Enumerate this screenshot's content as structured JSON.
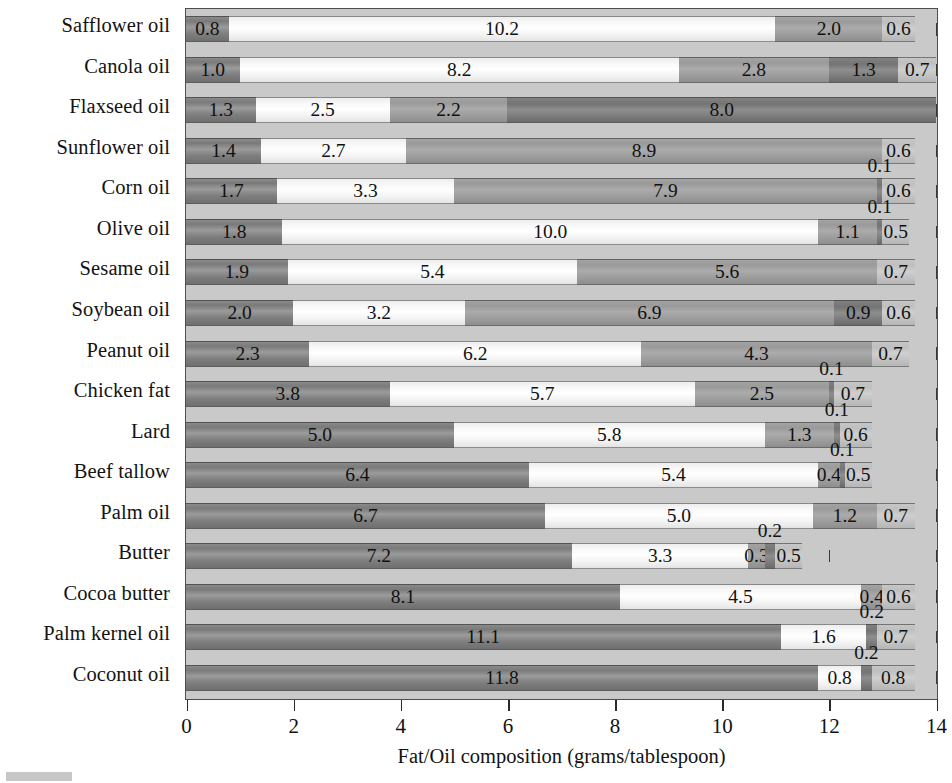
{
  "chart_data": {
    "type": "bar",
    "orientation": "horizontal",
    "stacked": true,
    "title": "",
    "xlabel": "Fat/Oil composition (grams/tablespoon)",
    "ylabel": "",
    "xlim": [
      0,
      14
    ],
    "xticks": [
      0,
      2,
      4,
      6,
      8,
      10,
      12,
      14
    ],
    "xticklabels": [
      "0",
      "2",
      "4",
      "6",
      "8",
      "10",
      "12",
      "14"
    ],
    "grid": true,
    "legend": "none",
    "categories": [
      "Safflower oil",
      "Canola oil",
      "Flaxseed oil",
      "Sunflower oil",
      "Corn oil",
      "Olive oil",
      "Sesame oil",
      "Soybean oil",
      "Peanut oil",
      "Chicken fat",
      "Lard",
      "Beef tallow",
      "Palm oil",
      "Butter",
      "Cocoa butter",
      "Palm kernel oil",
      "Coconut oil"
    ],
    "series": [
      {
        "name": "Saturated fat",
        "color": "#7e7e7e",
        "values": [
          0.8,
          1.0,
          1.3,
          1.4,
          1.7,
          1.8,
          1.9,
          2.0,
          2.3,
          3.8,
          5.0,
          6.4,
          6.7,
          7.2,
          8.1,
          11.1,
          11.8
        ]
      },
      {
        "name": "Monounsaturated fat",
        "color": "#f7f7f7",
        "values": [
          10.2,
          8.2,
          2.5,
          2.7,
          3.3,
          10.0,
          5.4,
          3.2,
          6.2,
          5.7,
          5.8,
          5.4,
          5.0,
          3.3,
          4.5,
          1.6,
          0.8
        ]
      },
      {
        "name": "Polyunsaturated fat",
        "color": "#a0a0a0",
        "values": [
          2.0,
          2.8,
          2.2,
          8.9,
          7.9,
          1.1,
          5.6,
          6.9,
          4.3,
          2.5,
          1.3,
          0.4,
          1.2,
          0.3,
          0.4,
          0.0,
          0.0
        ]
      },
      {
        "name": "Trans fat",
        "color": "#7a7a7a",
        "values": [
          0.0,
          0.0,
          8.0,
          0.0,
          0.1,
          0.1,
          0.0,
          0.0,
          0.1,
          0.1,
          0.1,
          0.1,
          0.0,
          0.2,
          0.0,
          0.2,
          0.2
        ]
      },
      {
        "name": "Other",
        "color": "#c4c4c4",
        "values": [
          0.6,
          0.7,
          0.0,
          0.6,
          0.6,
          0.5,
          0.7,
          0.6,
          0.7,
          0.7,
          0.6,
          0.5,
          0.7,
          0.5,
          0.6,
          0.7,
          0.8
        ]
      }
    ],
    "rows": [
      {
        "label": "Safflower oil",
        "segments": [
          {
            "series": "Saturated fat",
            "value": 0.8,
            "label": "0.8",
            "label_position": "inside"
          },
          {
            "series": "Monounsaturated fat",
            "value": 10.2,
            "label": "10.2",
            "label_position": "inside"
          },
          {
            "series": "Polyunsaturated fat",
            "value": 2.0,
            "label": "2.0",
            "label_position": "inside"
          },
          {
            "series": "Other",
            "value": 0.6,
            "label": "0.6",
            "label_position": "inside"
          }
        ]
      },
      {
        "label": "Canola oil",
        "segments": [
          {
            "series": "Saturated fat",
            "value": 1.0,
            "label": "1.0",
            "label_position": "inside"
          },
          {
            "series": "Monounsaturated fat",
            "value": 8.2,
            "label": "8.2",
            "label_position": "inside"
          },
          {
            "series": "Polyunsaturated fat",
            "value": 2.8,
            "label": "2.8",
            "label_position": "inside"
          },
          {
            "series": "Trans fat",
            "value": 1.3,
            "label": "1.3",
            "label_position": "inside"
          },
          {
            "series": "Other",
            "value": 0.7,
            "label": "0.7",
            "label_position": "inside"
          }
        ]
      },
      {
        "label": "Flaxseed oil",
        "segments": [
          {
            "series": "Saturated fat",
            "value": 1.3,
            "label": "1.3",
            "label_position": "inside"
          },
          {
            "series": "Monounsaturated fat",
            "value": 2.5,
            "label": "2.5",
            "label_position": "inside"
          },
          {
            "series": "Polyunsaturated fat",
            "value": 2.2,
            "label": "2.2",
            "label_position": "inside"
          },
          {
            "series": "Trans fat",
            "value": 8.0,
            "label": "8.0",
            "label_position": "inside"
          }
        ]
      },
      {
        "label": "Sunflower oil",
        "segments": [
          {
            "series": "Saturated fat",
            "value": 1.4,
            "label": "1.4",
            "label_position": "inside"
          },
          {
            "series": "Monounsaturated fat",
            "value": 2.7,
            "label": "2.7",
            "label_position": "inside"
          },
          {
            "series": "Polyunsaturated fat",
            "value": 8.9,
            "label": "8.9",
            "label_position": "inside"
          },
          {
            "series": "Other",
            "value": 0.6,
            "label": "0.6",
            "label_position": "inside"
          }
        ]
      },
      {
        "label": "Corn oil",
        "segments": [
          {
            "series": "Saturated fat",
            "value": 1.7,
            "label": "1.7",
            "label_position": "inside"
          },
          {
            "series": "Monounsaturated fat",
            "value": 3.3,
            "label": "3.3",
            "label_position": "inside"
          },
          {
            "series": "Polyunsaturated fat",
            "value": 7.9,
            "label": "7.9",
            "label_position": "inside"
          },
          {
            "series": "Trans fat",
            "value": 0.1,
            "label": "0.1",
            "label_position": "above"
          },
          {
            "series": "Other",
            "value": 0.6,
            "label": "0.6",
            "label_position": "inside"
          }
        ]
      },
      {
        "label": "Olive oil",
        "segments": [
          {
            "series": "Saturated fat",
            "value": 1.8,
            "label": "1.8",
            "label_position": "inside"
          },
          {
            "series": "Monounsaturated fat",
            "value": 10.0,
            "label": "10.0",
            "label_position": "inside"
          },
          {
            "series": "Polyunsaturated fat",
            "value": 1.1,
            "label": "1.1",
            "label_position": "inside"
          },
          {
            "series": "Trans fat",
            "value": 0.1,
            "label": "0.1",
            "label_position": "above"
          },
          {
            "series": "Other",
            "value": 0.5,
            "label": "0.5",
            "label_position": "inside"
          }
        ]
      },
      {
        "label": "Sesame oil",
        "segments": [
          {
            "series": "Saturated fat",
            "value": 1.9,
            "label": "1.9",
            "label_position": "inside"
          },
          {
            "series": "Monounsaturated fat",
            "value": 5.4,
            "label": "5.4",
            "label_position": "inside"
          },
          {
            "series": "Polyunsaturated fat",
            "value": 5.6,
            "label": "5.6",
            "label_position": "inside"
          },
          {
            "series": "Other",
            "value": 0.7,
            "label": "0.7",
            "label_position": "inside"
          }
        ]
      },
      {
        "label": "Soybean oil",
        "segments": [
          {
            "series": "Saturated fat",
            "value": 2.0,
            "label": "2.0",
            "label_position": "inside"
          },
          {
            "series": "Monounsaturated fat",
            "value": 3.2,
            "label": "3.2",
            "label_position": "inside"
          },
          {
            "series": "Polyunsaturated fat",
            "value": 6.9,
            "label": "6.9",
            "label_position": "inside"
          },
          {
            "series": "Trans fat",
            "value": 0.9,
            "label": "0.9",
            "label_position": "inside"
          },
          {
            "series": "Other",
            "value": 0.6,
            "label": "0.6",
            "label_position": "inside"
          }
        ]
      },
      {
        "label": "Peanut oil",
        "segments": [
          {
            "series": "Saturated fat",
            "value": 2.3,
            "label": "2.3",
            "label_position": "inside"
          },
          {
            "series": "Monounsaturated fat",
            "value": 6.2,
            "label": "6.2",
            "label_position": "inside"
          },
          {
            "series": "Polyunsaturated fat",
            "value": 4.3,
            "label": "4.3",
            "label_position": "inside"
          },
          {
            "series": "Other",
            "value": 0.7,
            "label": "0.7",
            "label_position": "inside"
          }
        ]
      },
      {
        "label": "Chicken fat",
        "segments": [
          {
            "series": "Saturated fat",
            "value": 3.8,
            "label": "3.8",
            "label_position": "inside"
          },
          {
            "series": "Monounsaturated fat",
            "value": 5.7,
            "label": "5.7",
            "label_position": "inside"
          },
          {
            "series": "Polyunsaturated fat",
            "value": 2.5,
            "label": "2.5",
            "label_position": "inside"
          },
          {
            "series": "Trans fat",
            "value": 0.1,
            "label": "0.1",
            "label_position": "above"
          },
          {
            "series": "Other",
            "value": 0.7,
            "label": "0.7",
            "label_position": "inside"
          }
        ]
      },
      {
        "label": "Lard",
        "segments": [
          {
            "series": "Saturated fat",
            "value": 5.0,
            "label": "5.0",
            "label_position": "inside"
          },
          {
            "series": "Monounsaturated fat",
            "value": 5.8,
            "label": "5.8",
            "label_position": "inside"
          },
          {
            "series": "Polyunsaturated fat",
            "value": 1.3,
            "label": "1.3",
            "label_position": "inside"
          },
          {
            "series": "Trans fat",
            "value": 0.1,
            "label": "0.1",
            "label_position": "above"
          },
          {
            "series": "Other",
            "value": 0.6,
            "label": "0.6",
            "label_position": "inside"
          }
        ]
      },
      {
        "label": "Beef tallow",
        "segments": [
          {
            "series": "Saturated fat",
            "value": 6.4,
            "label": "6.4",
            "label_position": "inside"
          },
          {
            "series": "Monounsaturated fat",
            "value": 5.4,
            "label": "5.4",
            "label_position": "inside"
          },
          {
            "series": "Polyunsaturated fat",
            "value": 0.4,
            "label": "0.4",
            "label_position": "inside"
          },
          {
            "series": "Trans fat",
            "value": 0.1,
            "label": "0.1",
            "label_position": "above"
          },
          {
            "series": "Other",
            "value": 0.5,
            "label": "0.5",
            "label_position": "inside"
          }
        ]
      },
      {
        "label": "Palm oil",
        "segments": [
          {
            "series": "Saturated fat",
            "value": 6.7,
            "label": "6.7",
            "label_position": "inside"
          },
          {
            "series": "Monounsaturated fat",
            "value": 5.0,
            "label": "5.0",
            "label_position": "inside"
          },
          {
            "series": "Polyunsaturated fat",
            "value": 1.2,
            "label": "1.2",
            "label_position": "inside"
          },
          {
            "series": "Other",
            "value": 0.7,
            "label": "0.7",
            "label_position": "inside"
          }
        ]
      },
      {
        "label": "Butter",
        "segments": [
          {
            "series": "Saturated fat",
            "value": 7.2,
            "label": "7.2",
            "label_position": "inside"
          },
          {
            "series": "Monounsaturated fat",
            "value": 3.3,
            "label": "3.3",
            "label_position": "inside"
          },
          {
            "series": "Polyunsaturated fat",
            "value": 0.3,
            "label": "0.3",
            "label_position": "inside"
          },
          {
            "series": "Trans fat",
            "value": 0.2,
            "label": "0.2",
            "label_position": "above"
          },
          {
            "series": "Other",
            "value": 0.5,
            "label": "0.5",
            "label_position": "inside"
          }
        ]
      },
      {
        "label": "Cocoa butter",
        "segments": [
          {
            "series": "Saturated fat",
            "value": 8.1,
            "label": "8.1",
            "label_position": "inside"
          },
          {
            "series": "Monounsaturated fat",
            "value": 4.5,
            "label": "4.5",
            "label_position": "inside"
          },
          {
            "series": "Polyunsaturated fat",
            "value": 0.4,
            "label": "0.4",
            "label_position": "inside"
          },
          {
            "series": "Other",
            "value": 0.6,
            "label": "0.6",
            "label_position": "inside"
          }
        ]
      },
      {
        "label": "Palm kernel oil",
        "segments": [
          {
            "series": "Saturated fat",
            "value": 11.1,
            "label": "11.1",
            "label_position": "inside"
          },
          {
            "series": "Monounsaturated fat",
            "value": 1.6,
            "label": "1.6",
            "label_position": "inside"
          },
          {
            "series": "Trans fat",
            "value": 0.2,
            "label": "0.2",
            "label_position": "above"
          },
          {
            "series": "Other",
            "value": 0.7,
            "label": "0.7",
            "label_position": "inside"
          }
        ]
      },
      {
        "label": "Coconut oil",
        "segments": [
          {
            "series": "Saturated fat",
            "value": 11.8,
            "label": "11.8",
            "label_position": "inside"
          },
          {
            "series": "Monounsaturated fat",
            "value": 0.8,
            "label": "0.8",
            "label_position": "inside"
          },
          {
            "series": "Trans fat",
            "value": 0.2,
            "label": "0.2",
            "label_position": "above"
          },
          {
            "series": "Other",
            "value": 0.8,
            "label": "0.8",
            "label_position": "inside"
          }
        ]
      }
    ]
  },
  "colors": {
    "plot_background": "#c9c9c9",
    "page_background": "#ffffff",
    "axis": "#2b2b2b",
    "text": "#121212",
    "saturated": "#7e7e7e",
    "monounsaturated": "#f7f7f7",
    "polyunsaturated": "#a0a0a0",
    "trans": "#7a7a7a",
    "other": "#c4c4c4"
  }
}
